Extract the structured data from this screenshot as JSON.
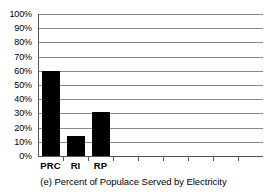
{
  "chart_data": {
    "type": "bar",
    "title": "",
    "caption": "(e) Percent of Populace Served by Electricity",
    "xlabel": "",
    "ylabel": "",
    "categories": [
      "PRC",
      "RI",
      "RP"
    ],
    "values": [
      60,
      14,
      31
    ],
    "ylim": [
      0,
      100
    ],
    "ytick_values": [
      0,
      10,
      20,
      30,
      40,
      50,
      60,
      70,
      80,
      90,
      100
    ],
    "ytick_labels": [
      "0%",
      "10%",
      "20%",
      "30%",
      "40%",
      "50%",
      "60%",
      "70%",
      "80%",
      "90%",
      "100%"
    ],
    "grid": true,
    "grid_axis": "y",
    "legend": false,
    "bar_color": "#000000",
    "grid_color": "#8a8a8a",
    "axis_color": "#555555",
    "background_color": "#ffffff",
    "total_category_slots": 9,
    "empty_slots_note": "x-axis extends past the three plotted bars with unlabeled tick marks"
  }
}
